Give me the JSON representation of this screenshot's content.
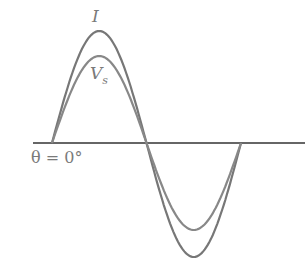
{
  "diagram": {
    "type": "waveform",
    "labels": {
      "current": "I",
      "voltage": "V",
      "voltage_sub": "s",
      "theta": "θ = 0°"
    },
    "colors": {
      "wave": "#777777",
      "axis": "#333333",
      "label": "#7a7a7a"
    }
  },
  "chart_data": {
    "type": "line",
    "title": "",
    "xlabel": "",
    "ylabel": "",
    "annotations": [
      "θ = 0°"
    ],
    "series": [
      {
        "name": "I",
        "description": "sine wave, larger amplitude, in phase with Vs",
        "relative_amplitude": 1.0
      },
      {
        "name": "Vs",
        "description": "sine wave, smaller amplitude, in phase with I",
        "relative_amplitude": 0.78
      }
    ],
    "x": [
      "0°",
      "90°",
      "180°",
      "270°",
      "360°"
    ]
  }
}
